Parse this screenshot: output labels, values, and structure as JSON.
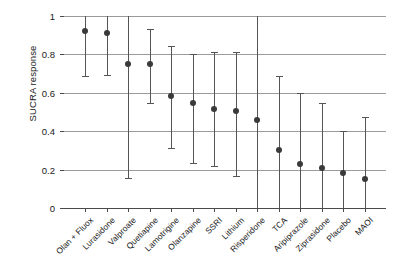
{
  "chart_data": {
    "type": "scatter",
    "title": "",
    "subtitle": "",
    "xlabel": "",
    "ylabel": "SUCRA response",
    "ylim": [
      0,
      1
    ],
    "yticks": [
      0,
      0.2,
      0.4,
      0.6,
      0.8,
      1
    ],
    "ytick_labels": [
      "0",
      "0.2",
      "0.4",
      "0.6",
      "0.8",
      "1"
    ],
    "grid": true,
    "legend": "none",
    "error_bar_style": "vertical-line-with-caps",
    "categories": [
      "Olan + Fluox",
      "Lurasidone",
      "Valproate",
      "Quetiapine",
      "Lamotrigine",
      "Olanzapine",
      "SSRI",
      "Lithium",
      "Risperidone",
      "TCA",
      "Aripiprazole",
      "Ziprasidone",
      "Placebo",
      "MAOI"
    ],
    "values": [
      0.92,
      0.91,
      0.75,
      0.75,
      0.585,
      0.545,
      0.515,
      0.505,
      0.46,
      0.3,
      0.23,
      0.21,
      0.18,
      0.15
    ],
    "ci_lower": [
      0.69,
      0.695,
      0.155,
      0.545,
      0.315,
      0.235,
      0.22,
      0.165,
      0.0,
      0.0,
      0.0,
      0.0,
      0.0,
      0.0
    ],
    "ci_upper": [
      1.0,
      1.0,
      1.0,
      0.93,
      0.845,
      0.8,
      0.81,
      0.815,
      1.0,
      0.685,
      0.6,
      0.545,
      0.4,
      0.475
    ],
    "series": [
      {
        "name": "SUCRA response",
        "points": [
          {
            "category": "Olan + Fluox",
            "value": 0.92,
            "low": 0.69,
            "high": 1.0
          },
          {
            "category": "Lurasidone",
            "value": 0.91,
            "low": 0.695,
            "high": 1.0
          },
          {
            "category": "Valproate",
            "value": 0.75,
            "low": 0.155,
            "high": 1.0
          },
          {
            "category": "Quetiapine",
            "value": 0.75,
            "low": 0.545,
            "high": 0.93
          },
          {
            "category": "Lamotrigine",
            "value": 0.585,
            "low": 0.315,
            "high": 0.845
          },
          {
            "category": "Olanzapine",
            "value": 0.545,
            "low": 0.235,
            "high": 0.8
          },
          {
            "category": "SSRI",
            "value": 0.515,
            "low": 0.22,
            "high": 0.81
          },
          {
            "category": "Lithium",
            "value": 0.505,
            "low": 0.165,
            "high": 0.815
          },
          {
            "category": "Risperidone",
            "value": 0.46,
            "low": 0.0,
            "high": 1.0
          },
          {
            "category": "TCA",
            "value": 0.3,
            "low": 0.0,
            "high": 0.685
          },
          {
            "category": "Aripiprazole",
            "value": 0.23,
            "low": 0.0,
            "high": 0.6
          },
          {
            "category": "Ziprasidone",
            "value": 0.21,
            "low": 0.0,
            "high": 0.545
          },
          {
            "category": "Placebo",
            "value": 0.18,
            "low": 0.0,
            "high": 0.4
          },
          {
            "category": "MAOI",
            "value": 0.15,
            "low": 0.0,
            "high": 0.475
          }
        ]
      }
    ]
  },
  "style": {
    "marker_color": "#3a3a3a",
    "error_color": "#555555",
    "grid_color": "#9b9b9b",
    "axis_color": "#4a4a4a",
    "background": "#ffffff"
  }
}
